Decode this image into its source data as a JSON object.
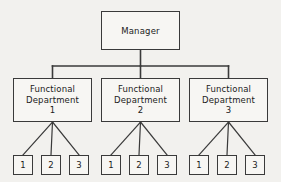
{
  "diagram": {
    "type": "org-chart",
    "background_color": "#f2f1ee",
    "line_color": "#3a3a3a",
    "box_fill_color": "#f7f6f3",
    "text_color": "#1b1b1b"
  },
  "root": {
    "label": "Manager",
    "x": 101,
    "y": 11,
    "width": 79,
    "height": 39
  },
  "departments": [
    {
      "line1": "Functional",
      "line2": "Department",
      "line3": "1",
      "x": 13,
      "y": 78,
      "width": 79,
      "height": 44,
      "children": [
        {
          "label": "1",
          "x": 13,
          "y": 155,
          "width": 20,
          "height": 20
        },
        {
          "label": "2",
          "x": 41,
          "y": 155,
          "width": 20,
          "height": 20
        },
        {
          "label": "3",
          "x": 69,
          "y": 155,
          "width": 20,
          "height": 20
        }
      ]
    },
    {
      "line1": "Functional",
      "line2": "Department",
      "line3": "2",
      "x": 101,
      "y": 78,
      "width": 79,
      "height": 44,
      "children": [
        {
          "label": "1",
          "x": 101,
          "y": 155,
          "width": 20,
          "height": 20
        },
        {
          "label": "2",
          "x": 129,
          "y": 155,
          "width": 20,
          "height": 20
        },
        {
          "label": "3",
          "x": 157,
          "y": 155,
          "width": 20,
          "height": 20
        }
      ]
    },
    {
      "line1": "Functional",
      "line2": "Department",
      "line3": "3",
      "x": 189,
      "y": 78,
      "width": 79,
      "height": 44,
      "children": [
        {
          "label": "1",
          "x": 189,
          "y": 155,
          "width": 20,
          "height": 20
        },
        {
          "label": "2",
          "x": 217,
          "y": 155,
          "width": 20,
          "height": 20
        },
        {
          "label": "3",
          "x": 245,
          "y": 155,
          "width": 20,
          "height": 20
        }
      ]
    }
  ],
  "connectors": {
    "bus_y": 66,
    "root_stem_x": 140.5,
    "bus_left_x": 52.5,
    "bus_right_x": 228.5,
    "stem_width": 1.6,
    "bus_width": 1.6,
    "diagonal_width": 1.2
  }
}
